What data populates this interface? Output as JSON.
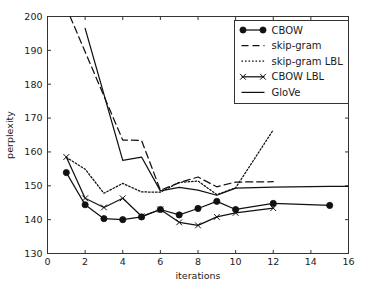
{
  "chart_data": {
    "type": "line",
    "title": "",
    "xlabel": "iterations",
    "ylabel": "perplexity",
    "xlim": [
      0,
      16
    ],
    "ylim": [
      130,
      200
    ],
    "xticks": [
      0,
      2,
      4,
      6,
      8,
      10,
      12,
      14,
      16
    ],
    "yticks": [
      130,
      140,
      150,
      160,
      170,
      180,
      190,
      200
    ],
    "grid": false,
    "legend_position": "upper right",
    "series": [
      {
        "name": "CBOW",
        "style": "solid-with-circle-markers",
        "marker": "circle",
        "x": [
          1,
          2,
          3,
          4,
          5,
          6,
          7,
          8,
          9,
          10,
          12,
          15
        ],
        "y": [
          153.9,
          144.4,
          140.3,
          140.0,
          140.8,
          143.0,
          141.4,
          143.3,
          145.4,
          143.0,
          144.8,
          144.2
        ]
      },
      {
        "name": "skip-gram",
        "style": "dashed",
        "marker": "none",
        "x": [
          1.2,
          4.0,
          5.0,
          6.0,
          7.0,
          8.0,
          9.0,
          10.0,
          12.0
        ],
        "y": [
          200.0,
          163.5,
          163.4,
          148.7,
          150.9,
          152.6,
          149.7,
          151.1,
          151.2
        ]
      },
      {
        "name": "skip-gram LBL",
        "style": "dotted",
        "marker": "none",
        "x": [
          1,
          2,
          3,
          4,
          5,
          6,
          7,
          8,
          9,
          10,
          12
        ],
        "y": [
          158.4,
          154.9,
          147.8,
          150.7,
          148.2,
          148.1,
          151.0,
          151.4,
          147.4,
          149.4,
          166.5
        ]
      },
      {
        "name": "CBOW LBL",
        "style": "solid-with-x-markers",
        "marker": "x",
        "x": [
          1,
          2,
          3,
          4,
          5,
          6,
          7,
          8,
          9,
          10,
          12
        ],
        "y": [
          158.5,
          146.3,
          143.6,
          146.3,
          141.0,
          143.0,
          139.2,
          138.3,
          140.8,
          142.0,
          143.4
        ]
      },
      {
        "name": "GloVe",
        "style": "solid",
        "marker": "none",
        "x": [
          2.0,
          4.0,
          5.0,
          6.0,
          7.0,
          8.0,
          9.0,
          10.0,
          12.0,
          15.0,
          16.0
        ],
        "y": [
          196.5,
          157.5,
          158.5,
          148.5,
          149.5,
          148.7,
          147.2,
          149.3,
          149.6,
          149.8,
          149.8
        ]
      }
    ],
    "legend_entries": [
      {
        "label": "CBOW",
        "style": "solid-with-circle-markers"
      },
      {
        "label": "skip-gram",
        "style": "dashed"
      },
      {
        "label": "skip-gram LBL",
        "style": "dotted"
      },
      {
        "label": "CBOW LBL",
        "style": "solid-with-x-markers"
      },
      {
        "label": "GloVe",
        "style": "solid"
      }
    ]
  },
  "axes": {
    "xlabel": "iterations",
    "ylabel": "perplexity",
    "xticklabels": [
      "0",
      "2",
      "4",
      "6",
      "8",
      "10",
      "12",
      "14",
      "16"
    ],
    "yticklabels": [
      "130",
      "140",
      "150",
      "160",
      "170",
      "180",
      "190",
      "200"
    ]
  },
  "legend": {
    "items": [
      "CBOW",
      "skip-gram",
      "skip-gram LBL",
      "CBOW LBL",
      "GloVe"
    ]
  },
  "colors": {
    "line": "#111111",
    "frame": "#333333",
    "background": "#ffffff",
    "text": "#1a1a1a"
  }
}
